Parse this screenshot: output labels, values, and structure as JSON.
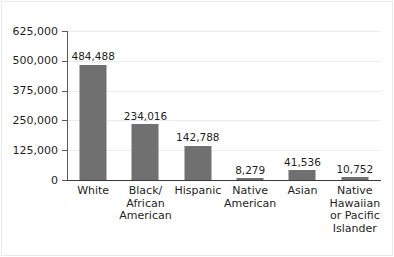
{
  "chart_data": {
    "type": "bar",
    "title": "",
    "xlabel": "",
    "ylabel": "",
    "categories": [
      "White",
      "Black/ African American",
      "Hispanic",
      "Native American",
      "Asian",
      "Native Hawaiian or Pacific Islander"
    ],
    "category_lines": [
      [
        "White"
      ],
      [
        "Black/",
        "African",
        "American"
      ],
      [
        "Hispanic"
      ],
      [
        "Native",
        "American"
      ],
      [
        "Asian"
      ],
      [
        "Native",
        "Hawaiian",
        "or Pacific",
        "Islander"
      ]
    ],
    "values": [
      484488,
      234016,
      142788,
      8279,
      41536,
      10752
    ],
    "value_labels": [
      "484,488",
      "234,016",
      "142,788",
      "8,279",
      "41,536",
      "10,752"
    ],
    "ylim": [
      0,
      625000
    ],
    "ytick_values": [
      0,
      125000,
      250000,
      375000,
      500000,
      625000
    ],
    "ytick_labels": [
      "0",
      "125,000",
      "250,000",
      "375,000",
      "500,000",
      "625,000"
    ],
    "grid": true,
    "legend": false,
    "bar_color": "#707070",
    "gridline_color": "#ededed",
    "axis_color": "#58595b",
    "text_color": "#231f20"
  }
}
